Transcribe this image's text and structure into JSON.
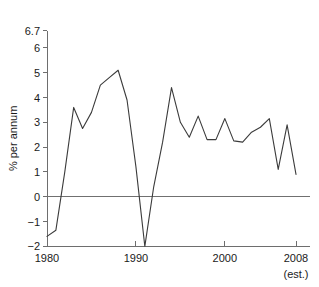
{
  "chart_data": {
    "type": "line",
    "title": "",
    "xlabel": "",
    "ylabel": "% per annum",
    "xlim": [
      1980,
      2008
    ],
    "ylim": [
      -2,
      6.7
    ],
    "grid": false,
    "legend": false,
    "x_ticks": [
      "1980",
      "1990",
      "2000",
      "2008"
    ],
    "x_tick_values": [
      1980,
      1990,
      2000,
      2008
    ],
    "y_ticks": [
      "6.7",
      "6",
      "5",
      "4",
      "3",
      "2",
      "1",
      "0",
      "-1",
      "-2"
    ],
    "y_tick_values": [
      6.7,
      6,
      5,
      4,
      3,
      2,
      1,
      0,
      -1,
      -2
    ],
    "annotation": "(est.)",
    "zero_reference_line": 0,
    "line_color": "#3b3b3b",
    "axis_color": "#6e6e6e",
    "series": [
      {
        "name": "% per annum",
        "x": [
          1980,
          1981,
          1982,
          1983,
          1984,
          1985,
          1986,
          1987,
          1988,
          1989,
          1990,
          1991,
          1992,
          1993,
          1994,
          1995,
          1996,
          1997,
          1998,
          1999,
          2000,
          2001,
          2002,
          2003,
          2004,
          2005,
          2006,
          2007,
          2008
        ],
        "values": [
          -1.6,
          -1.35,
          1.0,
          3.6,
          2.75,
          3.4,
          4.5,
          4.8,
          5.1,
          3.9,
          1.2,
          -2.0,
          0.4,
          2.2,
          4.4,
          3.0,
          2.4,
          3.25,
          2.3,
          2.3,
          3.15,
          2.25,
          2.2,
          2.6,
          2.8,
          3.15,
          1.1,
          2.9,
          0.9
        ]
      }
    ]
  },
  "labels": {
    "y_axis_title": "% per annum",
    "estimate_note": "(est.)"
  }
}
